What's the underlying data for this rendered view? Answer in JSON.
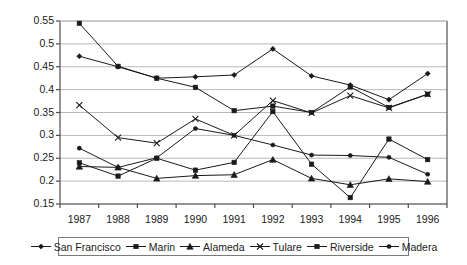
{
  "chart_data": {
    "type": "line",
    "title": "",
    "subtitle": "",
    "xlabel": "",
    "ylabel": "",
    "grid": true,
    "legend_position": "bottom",
    "categories": [
      "1987",
      "1988",
      "1989",
      "1990",
      "1991",
      "1992",
      "1993",
      "1994",
      "1995",
      "1996"
    ],
    "x": [
      1987,
      1988,
      1989,
      1990,
      1991,
      1992,
      1993,
      1994,
      1995,
      1996
    ],
    "ylim": [
      0.15,
      0.55
    ],
    "yticks": [
      "0.15",
      "0.2",
      "0.25",
      "0.3",
      "0.35",
      "0.4",
      "0.45",
      "0.5",
      "0.55"
    ],
    "ytick_values": [
      0.15,
      0.2,
      0.25,
      0.3,
      0.35,
      0.4,
      0.45,
      0.5,
      0.55
    ],
    "series": [
      {
        "name": "San Francisco",
        "marker": "diamond",
        "color": "#1a1a1a",
        "values": [
          0.473,
          0.45,
          0.425,
          0.428,
          0.432,
          0.489,
          0.43,
          0.41,
          0.378,
          0.435
        ]
      },
      {
        "name": "Marin",
        "marker": "square",
        "color": "#1a1a1a",
        "values": [
          0.545,
          0.451,
          0.425,
          0.405,
          0.354,
          0.364,
          0.35,
          0.406,
          0.361,
          0.39
        ]
      },
      {
        "name": "Alameda",
        "marker": "triangle",
        "color": "#1a1a1a",
        "values": [
          0.232,
          0.23,
          0.206,
          0.212,
          0.214,
          0.247,
          0.206,
          0.192,
          0.205,
          0.199
        ]
      },
      {
        "name": "Tulare",
        "marker": "cross",
        "color": "#1a1a1a",
        "values": [
          0.366,
          0.295,
          0.283,
          0.336,
          0.3,
          0.376,
          0.349,
          0.387,
          0.36,
          0.39
        ]
      },
      {
        "name": "Riverside",
        "marker": "square",
        "color": "#1a1a1a",
        "values": [
          0.24,
          0.211,
          0.25,
          0.224,
          0.241,
          0.352,
          0.237,
          0.164,
          0.292,
          0.247
        ]
      },
      {
        "name": "Madera",
        "marker": "dot",
        "color": "#1a1a1a",
        "values": [
          0.272,
          0.23,
          0.251,
          0.315,
          0.3,
          0.279,
          0.257,
          0.256,
          0.252,
          0.215
        ]
      }
    ]
  },
  "legend": {
    "items": [
      {
        "label": "San Francisco",
        "marker": "diamond"
      },
      {
        "label": "Marin",
        "marker": "square"
      },
      {
        "label": "Alameda",
        "marker": "triangle"
      },
      {
        "label": "Tulare",
        "marker": "cross"
      },
      {
        "label": "Riverside",
        "marker": "square"
      },
      {
        "label": "Madera",
        "marker": "dot"
      }
    ]
  },
  "style": {
    "line_color": "#1a1a1a",
    "grid_color": "#b8b8b8",
    "axis_color": "#4d4d4d",
    "text_color": "#1a1a1a",
    "background": "#ffffff"
  }
}
